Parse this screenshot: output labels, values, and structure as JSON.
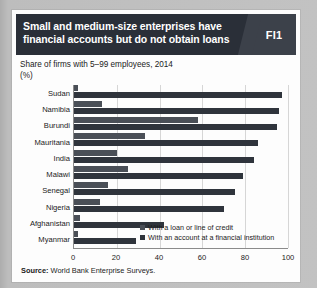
{
  "figure": {
    "badge": "FI1",
    "title_line1": "Small and medium-size enterprises have",
    "title_line2": "financial accounts but do not obtain loans",
    "subtitle": "Share of firms with 5–99 employees, 2014",
    "unit": "(%)",
    "source_label": "Source:",
    "source_text": "World Bank Enterprise Surveys.",
    "colors": {
      "title_bar": "#2a2f38",
      "badge_bg": "#3c414a",
      "loan_bar": "#4a4f57",
      "account_bar": "#2f343c",
      "card_bg": "#fdfdfd",
      "page_bg": "#bdbdbd",
      "gridline": "#d6d6d6"
    }
  },
  "chart_data": {
    "type": "bar",
    "orientation": "horizontal",
    "title": "Small and medium-size enterprises have financial accounts but do not obtain loans",
    "subtitle": "Share of firms with 5–99 employees, 2014",
    "xlabel": "(%)",
    "ylabel": "",
    "xlim": [
      0,
      100
    ],
    "xticks": [
      0,
      20,
      40,
      60,
      80,
      100
    ],
    "grid": true,
    "legend_position": "inside-bottom-right",
    "categories": [
      "Sudan",
      "Namibia",
      "Burundi",
      "Mauritania",
      "India",
      "Malawi",
      "Senegal",
      "Nigeria",
      "Afghanistan",
      "Myanmar"
    ],
    "series": [
      {
        "name": "With a loan or line of credit",
        "color": "#4a4f57",
        "values": [
          2,
          13,
          58,
          33,
          20,
          25,
          16,
          12,
          3,
          2
        ]
      },
      {
        "name": "With an account at a financial institution",
        "color": "#2f343c",
        "values": [
          97,
          96,
          95,
          86,
          84,
          79,
          75,
          70,
          42,
          29
        ]
      }
    ]
  }
}
